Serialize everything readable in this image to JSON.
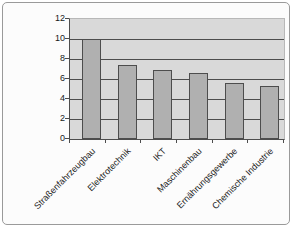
{
  "chart_data": {
    "type": "bar",
    "title": "",
    "xlabel": "",
    "ylabel": "",
    "categories": [
      "Straßenfahrzeugbau",
      "Elektrotechnik",
      "IKT",
      "Maschinenbau",
      "Ernährungsgewerbe",
      "Chemische Industrie"
    ],
    "values": [
      10,
      7.4,
      6.9,
      6.6,
      5.6,
      5.3
    ],
    "ylim": [
      0,
      12
    ],
    "yticks": [
      0,
      2,
      4,
      6,
      8,
      10,
      12
    ],
    "ytick_interval": 2,
    "grid": true,
    "legend": false,
    "colors": {
      "page_background": "#fcfcfc",
      "frame_border": "#9a9a9a",
      "plot_background": "#d9d9d9",
      "bar_fill": "#b0b0b0",
      "bar_border": "#4d4d4d",
      "gridline": "#4d4d4d",
      "axis_line": "#4d4d4d",
      "text": "#1a1a1a"
    }
  }
}
